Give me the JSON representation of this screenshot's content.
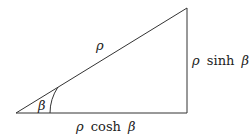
{
  "diagram": {
    "type": "right-triangle",
    "vertices": {
      "origin": [
        16,
        113
      ],
      "right_angle": [
        187,
        113
      ],
      "apex": [
        187,
        8
      ]
    },
    "labels": {
      "hypotenuse": "ρ",
      "opposite": "ρ sinh β",
      "adjacent": "ρ cosh β",
      "angle": "β"
    },
    "label_parts": {
      "opposite_rho": "ρ",
      "opposite_fn": "sinh",
      "opposite_beta": "β",
      "adjacent_rho": "ρ",
      "adjacent_fn": "cosh",
      "adjacent_beta": "β"
    },
    "colors": {
      "stroke": "#333333",
      "text": "#222222"
    }
  }
}
